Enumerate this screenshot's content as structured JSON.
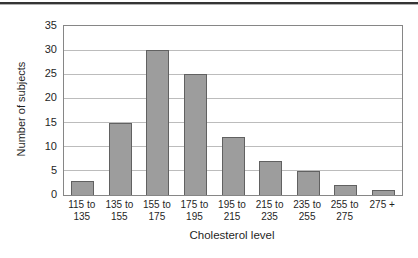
{
  "figure": {
    "background": "#ffffff",
    "top_rule_color": "#343434"
  },
  "chart_data": {
    "type": "bar",
    "title": "",
    "categories": [
      "115 to\n135",
      "135 to\n155",
      "155 to\n175",
      "175 to\n195",
      "195 to\n215",
      "215 to\n235",
      "235 to\n255",
      "255 to\n275",
      "275 +"
    ],
    "values": [
      3,
      15,
      30,
      25,
      12,
      7,
      5,
      2,
      1
    ],
    "xlabel": "Cholesterol level",
    "ylabel": "Number of subjects",
    "ylim": [
      0,
      35
    ],
    "yticks": [
      0,
      5,
      10,
      15,
      20,
      25,
      30,
      35
    ],
    "grid": true,
    "legend": "none",
    "bar_fill": "#9d9d9d",
    "bar_border": "#616161",
    "gridline_color": "#bcbcbc",
    "plot_border_color": "#868686",
    "text_color": "#1f1f1f"
  }
}
